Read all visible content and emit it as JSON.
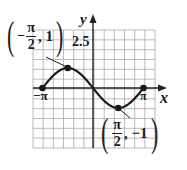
{
  "chart_data": {
    "type": "line",
    "function": "y = -sin(x)",
    "title": "",
    "xlabel": "x",
    "ylabel": "y",
    "xlim": [
      -3.14159,
      3.14159
    ],
    "ylim_label": "2.5",
    "x_ticks": [
      "-π",
      "π"
    ],
    "y_ticks": [
      "2.5"
    ],
    "grid": true,
    "key_points": [
      {
        "x": -3.14159,
        "y": 0,
        "label": "-π"
      },
      {
        "x": -1.5708,
        "y": 1,
        "label": "(-π/2, 1)"
      },
      {
        "x": 0,
        "y": 0
      },
      {
        "x": 1.5708,
        "y": -1,
        "label": "(π/2, -1)"
      },
      {
        "x": 3.14159,
        "y": 0,
        "label": "π"
      }
    ],
    "series": [
      {
        "name": "y = -sin x",
        "x": [
          -3.14159,
          -2.35619,
          -1.5708,
          -0.7854,
          0,
          0.7854,
          1.5708,
          2.35619,
          3.14159
        ],
        "values": [
          0,
          0.7071,
          1,
          0.7071,
          0,
          -0.7071,
          -1,
          -0.7071,
          0
        ]
      }
    ]
  },
  "labels": {
    "x_axis": "x",
    "y_axis": "y",
    "y_tick": "2.5",
    "neg_pi": "−π",
    "pos_pi": "π",
    "max_point": {
      "sign": "−",
      "num": "π",
      "den": "2",
      "rest": ", 1"
    },
    "min_point": {
      "sign": "",
      "num": "π",
      "den": "2",
      "rest": ", −1"
    }
  },
  "colors": {
    "grid": "#9a9a9a",
    "axis": "#222222",
    "curve": "#1a1a1a",
    "background": "#ffffff"
  }
}
